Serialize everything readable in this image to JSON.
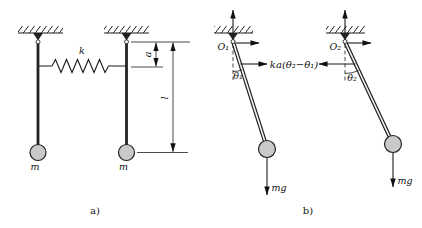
{
  "figure": {
    "background": "#ffffff",
    "line_color": "#1c1c1c",
    "mass_fill": "#c9c9c9",
    "part_a": {
      "caption": "a)",
      "spring_label": "k",
      "mass_left_label": "m",
      "mass_right_label": "m",
      "dim_a": "a",
      "dim_l": "l"
    },
    "part_b": {
      "caption": "b)",
      "pivot_left": "O₁",
      "pivot_right": "O₂",
      "angle_left": "θ₁",
      "angle_right": "θ₂",
      "spring_force": "ka(θ₂−θ₁)",
      "weight_left": "mg",
      "weight_right": "mg"
    }
  }
}
